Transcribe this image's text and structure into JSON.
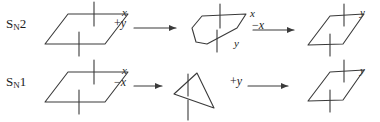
{
  "figure": {
    "background_color": "#ffffff",
    "stroke_color": "#3a3a3a",
    "text_color": "#1c1c1c"
  },
  "rows": [
    {
      "id": "sn2",
      "mechanism_label_prefix": "S",
      "mechanism_label_sub": "N",
      "mechanism_label_suffix": "2",
      "mechanism_label_plain": "SN2",
      "steps": [
        {
          "kind": "structure",
          "shape": "parallelogram",
          "name": "sn2-reactant",
          "substituent_labels": [
            {
              "text": "x",
              "position": "upper-right"
            }
          ]
        },
        {
          "kind": "arrow",
          "name": "sn2-arrow-1",
          "reagent_op": "+",
          "reagent_group": "y",
          "reagent_full": "+ y"
        },
        {
          "kind": "structure",
          "shape": "trigonal-bipyramid-transition-state",
          "name": "sn2-transition-state",
          "substituent_labels": [
            {
              "text": "x",
              "position": "upper-right"
            },
            {
              "text": "y",
              "position": "lower-right"
            }
          ]
        },
        {
          "kind": "arrow",
          "name": "sn2-arrow-2",
          "reagent_op": "−",
          "reagent_group": "x",
          "reagent_full": "−x"
        },
        {
          "kind": "structure",
          "shape": "parallelogram",
          "name": "sn2-product-inverted",
          "substituent_labels": [
            {
              "text": "y",
              "position": "upper-right"
            }
          ]
        }
      ]
    },
    {
      "id": "sn1",
      "mechanism_label_prefix": "S",
      "mechanism_label_sub": "N",
      "mechanism_label_suffix": "1",
      "mechanism_label_plain": "SN1",
      "steps": [
        {
          "kind": "structure",
          "shape": "parallelogram",
          "name": "sn1-reactant",
          "substituent_labels": [
            {
              "text": "x",
              "position": "upper-right"
            }
          ]
        },
        {
          "kind": "arrow",
          "name": "sn1-arrow-1",
          "reagent_op": "−",
          "reagent_group": "x",
          "reagent_full": "−x"
        },
        {
          "kind": "structure",
          "shape": "planar-carbocation-triangle",
          "name": "sn1-carbocation-intermediate",
          "substituent_labels": []
        },
        {
          "kind": "arrow",
          "name": "sn1-arrow-2",
          "reagent_op": "+",
          "reagent_group": "y",
          "reagent_full": "+ y"
        },
        {
          "kind": "structure",
          "shape": "parallelogram",
          "name": "sn1-product",
          "substituent_labels": [
            {
              "text": "y",
              "position": "upper-right"
            }
          ]
        }
      ]
    }
  ]
}
